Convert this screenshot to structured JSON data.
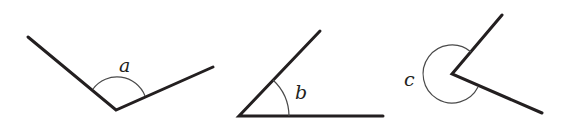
{
  "figure": {
    "angles": [
      {
        "id": "a",
        "label": "a",
        "type": "obtuse"
      },
      {
        "id": "b",
        "label": "b",
        "type": "acute"
      },
      {
        "id": "c",
        "label": "c",
        "type": "reflex"
      }
    ]
  }
}
